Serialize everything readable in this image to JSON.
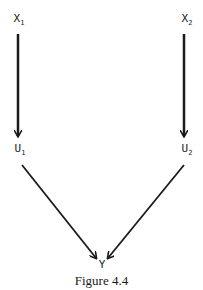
{
  "diagram": {
    "caption": "Figure 4.4",
    "nodes": [
      {
        "id": "X1",
        "base": "X",
        "sub": "1"
      },
      {
        "id": "X2",
        "base": "X",
        "sub": "2"
      },
      {
        "id": "U1",
        "base": "U",
        "sub": "1"
      },
      {
        "id": "U2",
        "base": "U",
        "sub": "2"
      },
      {
        "id": "Y",
        "base": "Y",
        "sub": ""
      }
    ],
    "edges": [
      {
        "from": "X1",
        "to": "U1"
      },
      {
        "from": "X2",
        "to": "U2"
      },
      {
        "from": "U1",
        "to": "Y"
      },
      {
        "from": "U2",
        "to": "Y"
      }
    ],
    "colors": {
      "ink": "#1a1a1a",
      "background": "#ffffff"
    }
  }
}
